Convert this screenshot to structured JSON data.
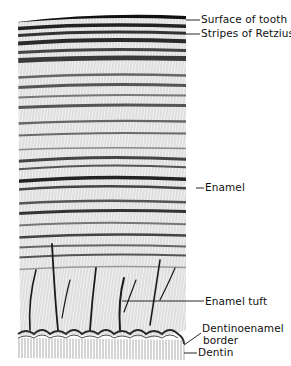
{
  "figure": {
    "labels": [
      {
        "id": "surface",
        "text": "Surface of tooth",
        "x": 201,
        "y": 14,
        "line_to": [
          186,
          20
        ]
      },
      {
        "id": "retzius",
        "text": "Stripes of Retzius",
        "x": 201,
        "y": 28,
        "line_to": [
          186,
          34
        ]
      },
      {
        "id": "enamel",
        "text": "Enamel",
        "x": 205,
        "y": 182,
        "line_to": [
          196,
          188
        ]
      },
      {
        "id": "tuft",
        "text": "Enamel tuft",
        "x": 205,
        "y": 296,
        "line_to": [
          122,
          301
        ]
      },
      {
        "id": "dej",
        "text": "Dentinoenamel",
        "x": 202,
        "y": 323,
        "line_to": [
          184,
          345
        ]
      },
      {
        "id": "dej2",
        "text": "border",
        "x": 203,
        "y": 335
      },
      {
        "id": "dentin",
        "text": "Dentin",
        "x": 198,
        "y": 347,
        "line_to": [
          184,
          353
        ]
      }
    ],
    "colors": {
      "ink": "#1a1a1a",
      "band_dark": "#3a3a3a",
      "band_mid": "#8a8a8a",
      "band_light": "#d6d6d6",
      "paper": "#ffffff"
    }
  }
}
